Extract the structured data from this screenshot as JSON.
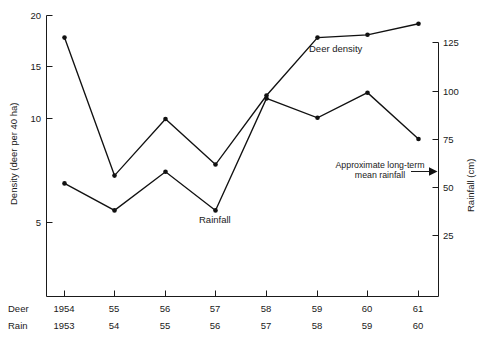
{
  "chart_data": {
    "type": "line",
    "title": "",
    "x": [
      "1954",
      "1955",
      "1956",
      "1957",
      "1958",
      "1959",
      "1960",
      "1961"
    ],
    "categories_deer": [
      "1954",
      "55",
      "56",
      "57",
      "58",
      "59",
      "60",
      "61"
    ],
    "categories_rain": [
      "1953",
      "54",
      "55",
      "56",
      "57",
      "58",
      "59",
      "60"
    ],
    "row_labels": {
      "deer": "Deer",
      "rain": "Rain"
    },
    "series": [
      {
        "name": "Deer density",
        "axis": "left",
        "unit": "deer per 40 ha",
        "values": [
          18.4,
          8.4,
          12.5,
          9.2,
          14.2,
          18.4,
          18.6,
          19.4
        ]
      },
      {
        "name": "Rainfall",
        "axis": "right",
        "unit": "cm",
        "values_left_scale": [
          7.0,
          4.2,
          8.0,
          4.3,
          12.5,
          10.9,
          13.0,
          10.0
        ],
        "values": [
          52,
          38,
          58,
          38,
          96,
          86,
          99,
          75
        ]
      }
    ],
    "left_axis": {
      "label": "Density (deer per 40 ha)",
      "ticks": [
        5,
        10,
        15,
        20
      ],
      "tick_labels": [
        "5",
        "10",
        "15",
        "20"
      ],
      "lim": [
        0,
        20
      ]
    },
    "right_axis": {
      "label": "Rainfall (cm)",
      "ticks": [
        25,
        50,
        75,
        100,
        125
      ],
      "tick_labels": [
        "25",
        "50",
        "75",
        "100",
        "125"
      ],
      "lim": [
        0,
        130
      ]
    },
    "xlabel": "",
    "grid": false,
    "legend": "inline-labels",
    "annotations": [
      {
        "name": "mean-rainfall-annotation",
        "line1": "Approximate long-term",
        "line2": "mean rainfall",
        "arrow": "right",
        "points_to_value": 62
      },
      {
        "name": "deer-density-label",
        "text": "Deer density"
      },
      {
        "name": "rainfall-label",
        "text": "Rainfall"
      }
    ],
    "colors": {
      "line": "#111111",
      "marker": "#111111",
      "axis": "#1a1a1a",
      "background": "#ffffff",
      "text": "#1a1a1a"
    }
  }
}
